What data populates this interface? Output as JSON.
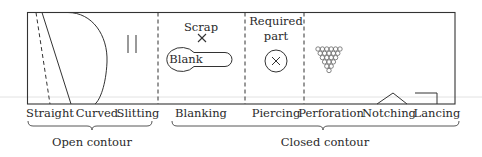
{
  "diagram": {
    "colors": {
      "stroke": "#333333",
      "text": "#2a2a2a",
      "artifact": "#dcdcdc"
    },
    "panels": [
      {
        "id": "open",
        "labels": [
          "Straight",
          "Curved",
          "Slitting"
        ]
      },
      {
        "id": "blanking",
        "annotations": {
          "scrap": "Scrap",
          "blank": "Blank"
        },
        "label": "Blanking"
      },
      {
        "id": "piercing",
        "annotations": {
          "required_part_line1": "Required",
          "required_part_line2": "part"
        },
        "label": "Piercing"
      },
      {
        "id": "closed-misc",
        "labels": [
          "Perforation",
          "Notching",
          "Lancing"
        ]
      }
    ],
    "groups": {
      "open": "Open contour",
      "closed": "Closed contour"
    }
  }
}
